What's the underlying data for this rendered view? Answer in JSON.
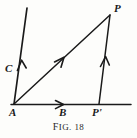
{
  "figure": {
    "caption_prefix": "F",
    "caption_rest": "IG",
    "caption_number": ". 18",
    "caption_full": "FIG. 18",
    "background_color": "#fdfdfb",
    "ink_color": "#1a1a1a",
    "width": 137,
    "height": 138
  },
  "labels": {
    "A": "A",
    "B": "B",
    "C": "C",
    "P": "P",
    "P_prime": "P'"
  },
  "geometry": {
    "points": {
      "A": {
        "x": 14,
        "y": 104
      },
      "B": {
        "x": 64,
        "y": 104
      },
      "C_line_top": {
        "x": 27,
        "y": 8
      },
      "P": {
        "x": 110,
        "y": 15
      },
      "P_prime": {
        "x": 99,
        "y": 104
      },
      "baseline_start": {
        "x": 11,
        "y": 104
      },
      "baseline_end": {
        "x": 131,
        "y": 104
      }
    },
    "segments": [
      {
        "name": "baseline-AB-Pprime",
        "from": "baseline_start",
        "to": "baseline_end",
        "arrow_at": {
          "x": 62,
          "y": 104
        },
        "arrow_direction": "right"
      },
      {
        "name": "ray-AC",
        "from": "A",
        "to": "C_line_top",
        "arrow_at": {
          "x": 22,
          "y": 62
        },
        "arrow_direction": "up"
      },
      {
        "name": "ray-AP",
        "from": "A",
        "to": "P",
        "arrow_at": {
          "x": 62,
          "y": 62
        },
        "arrow_direction": "up-right"
      },
      {
        "name": "ray-Pprime-P",
        "from": "P_prime",
        "to": "P",
        "arrow_at": {
          "x": 105,
          "y": 58
        },
        "arrow_direction": "up"
      }
    ]
  }
}
